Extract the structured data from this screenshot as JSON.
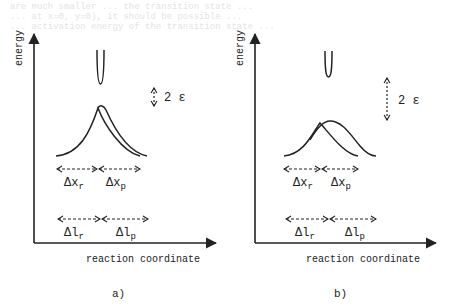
{
  "bleed_text": [
    "are much smaller ... the transition state ...",
    "... at x=0, y=0), it should be possible ... ",
    "... activation energy of the transition state ..."
  ],
  "panels": [
    {
      "id": "a",
      "caption": "a)",
      "y_axis_label": "energy",
      "x_axis_label": "reaction coordinate",
      "gap_label": "2 ε",
      "delta_x_reactant": "Δx",
      "delta_x_reactant_sub": "r",
      "delta_x_product": "Δx",
      "delta_x_product_sub": "p",
      "delta_l_reactant": "Δl",
      "delta_l_reactant_sub": "r",
      "delta_l_product": "Δl",
      "delta_l_product_sub": "p"
    },
    {
      "id": "b",
      "caption": "b)",
      "y_axis_label": "energy",
      "x_axis_label": "reaction coordinate",
      "gap_label": "2 ε",
      "delta_x_reactant": "Δx",
      "delta_x_reactant_sub": "r",
      "delta_x_product": "Δx",
      "delta_x_product_sub": "p",
      "delta_l_reactant": "Δl",
      "delta_l_reactant_sub": "r",
      "delta_l_product": "Δl",
      "delta_l_product_sub": "p"
    }
  ],
  "colors": {
    "ink": "#222222",
    "background": "#ffffff",
    "bleed": "#e4e4e4"
  }
}
